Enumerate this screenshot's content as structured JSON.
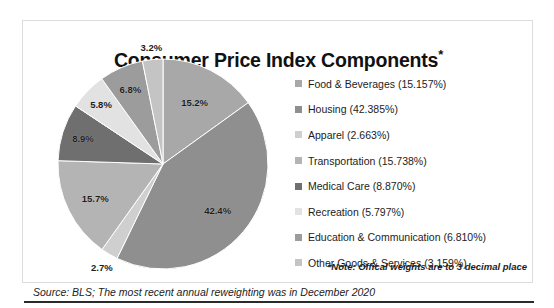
{
  "chart_data": {
    "type": "pie",
    "title": "Consumer Price Index Components*",
    "title_text": "Consumer Price Index Components",
    "title_asterisk": "*",
    "categories": [
      "Food & Beverages",
      "Housing",
      "Apparel",
      "Transportation",
      "Medical Care",
      "Recreation",
      "Education & Communication",
      "Other Goods & Services"
    ],
    "values": [
      15.157,
      42.385,
      2.663,
      15.738,
      8.87,
      5.797,
      6.81,
      3.159
    ],
    "slice_labels": [
      "15.2%",
      "42.4%",
      "2.7%",
      "15.7%",
      "8.9%",
      "5.8%",
      "6.8%",
      "3.2%"
    ],
    "colors": [
      "#a8a8a8",
      "#8f8f8f",
      "#cfcfcf",
      "#b4b4b4",
      "#6f6f6f",
      "#e2e2e2",
      "#9c9c9c",
      "#c4c4c4"
    ],
    "legend_position": "right",
    "grid": false,
    "note": "*Note: Offical weights are to 3 decimal place",
    "source": "Source: BLS; The most recent annual reweighting was in December 2020"
  },
  "legend": {
    "items": [
      {
        "label": "Food & Beverages (15.157%)",
        "color": "#a8a8a8"
      },
      {
        "label": "Housing (42.385%)",
        "color": "#8f8f8f"
      },
      {
        "label": "Apparel (2.663%)",
        "color": "#cfcfcf"
      },
      {
        "label": "Transportation (15.738%)",
        "color": "#b4b4b4"
      },
      {
        "label": "Medical Care (8.870%)",
        "color": "#6f6f6f"
      },
      {
        "label": "Recreation (5.797%)",
        "color": "#e2e2e2"
      },
      {
        "label": "Education & Communication (6.810%)",
        "color": "#9c9c9c"
      },
      {
        "label": "Other Goods & Services (3.159%)",
        "color": "#c4c4c4"
      }
    ]
  }
}
